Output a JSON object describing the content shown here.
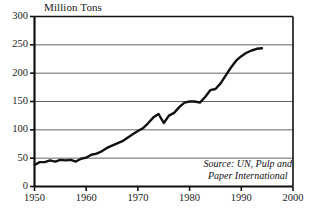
{
  "chart_data": {
    "type": "line",
    "title": "Million Tons",
    "xlabel": "",
    "ylabel": "",
    "xlim": [
      1950,
      2000
    ],
    "ylim": [
      0,
      300
    ],
    "grid": true,
    "legend_position": "none",
    "yticks": [
      0,
      50,
      100,
      150,
      200,
      250,
      300
    ],
    "ytick_labels": [
      "0",
      "50",
      "100",
      "150",
      "200",
      "250",
      "300"
    ],
    "xticks": [
      1950,
      1960,
      1970,
      1980,
      1990,
      2000
    ],
    "xtick_labels": [
      "1950",
      "1960",
      "1970",
      "1980",
      "1990",
      "2000"
    ],
    "annotations": [
      {
        "name": "source-note",
        "line1": "Source: UN, Pulp and",
        "line2": "Paper International"
      }
    ],
    "series": [
      {
        "name": "World paper and paperboard production",
        "color": "#111111",
        "x": [
          1950,
          1951,
          1952,
          1953,
          1954,
          1955,
          1956,
          1957,
          1958,
          1959,
          1960,
          1961,
          1962,
          1963,
          1964,
          1965,
          1966,
          1967,
          1968,
          1969,
          1970,
          1971,
          1972,
          1973,
          1974,
          1975,
          1976,
          1977,
          1978,
          1979,
          1980,
          1981,
          1982,
          1983,
          1984,
          1985,
          1986,
          1987,
          1988,
          1989,
          1990,
          1991,
          1992,
          1993,
          1994
        ],
        "values": [
          38,
          43,
          43,
          46,
          44,
          47,
          46,
          47,
          44,
          49,
          51,
          56,
          58,
          62,
          68,
          72,
          76,
          80,
          86,
          92,
          98,
          103,
          112,
          122,
          128,
          112,
          125,
          130,
          140,
          148,
          150,
          150,
          148,
          158,
          170,
          172,
          182,
          196,
          210,
          222,
          230,
          236,
          240,
          243,
          244
        ]
      }
    ]
  },
  "colors": {
    "line": "#111111",
    "grid": "#555555",
    "axis": "#111111",
    "background": "#ffffff"
  }
}
